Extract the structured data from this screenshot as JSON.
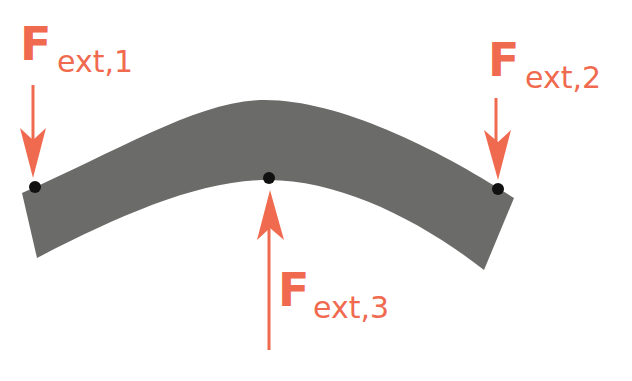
{
  "diagram": {
    "colors": {
      "beam": "#6b6b6a",
      "force": "#f06a4f",
      "point": "#111111",
      "background": "#ffffff"
    },
    "beam": {
      "shape": "curved-bar"
    },
    "forces": [
      {
        "id": "f1",
        "symbol": "F",
        "subscript": "ext,1",
        "direction": "down",
        "application_point": "left-end-top"
      },
      {
        "id": "f2",
        "symbol": "F",
        "subscript": "ext,2",
        "direction": "down",
        "application_point": "right-end-top"
      },
      {
        "id": "f3",
        "symbol": "F",
        "subscript": "ext,3",
        "direction": "up",
        "application_point": "middle-bottom"
      }
    ]
  }
}
